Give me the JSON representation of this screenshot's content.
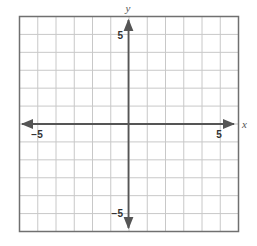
{
  "chart_data": {
    "type": "scatter",
    "title": "",
    "xlabel": "x",
    "ylabel": "y",
    "xlim": [
      -6,
      6
    ],
    "ylim": [
      -6,
      6
    ],
    "grid": true,
    "grid_step": 1,
    "x_tick_labels": [
      "−5",
      "5"
    ],
    "y_tick_labels": [
      "5",
      "−5"
    ],
    "series": [],
    "legend": null
  },
  "colors": {
    "grid": "#c8c8c8",
    "border": "#707070",
    "axis": "#555555"
  }
}
